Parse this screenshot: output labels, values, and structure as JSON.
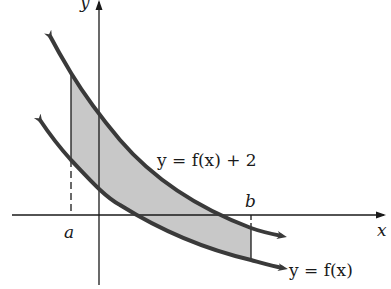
{
  "diagram": {
    "type": "area-between-curves",
    "axes": {
      "x_label": "x",
      "y_label": "y"
    },
    "bounds": {
      "a_label": "a",
      "b_label": "b"
    },
    "curves": [
      {
        "name": "upper",
        "label": "y = f(x) + 2"
      },
      {
        "name": "lower",
        "label": "y = f(x)"
      }
    ],
    "shaded_region": "region between y = f(x) + 2 and y = f(x) from x = a to x = b",
    "colors": {
      "curve": "#3a3a3a",
      "shade": "#c8c8c8",
      "axis": "#1a1a1a"
    }
  }
}
